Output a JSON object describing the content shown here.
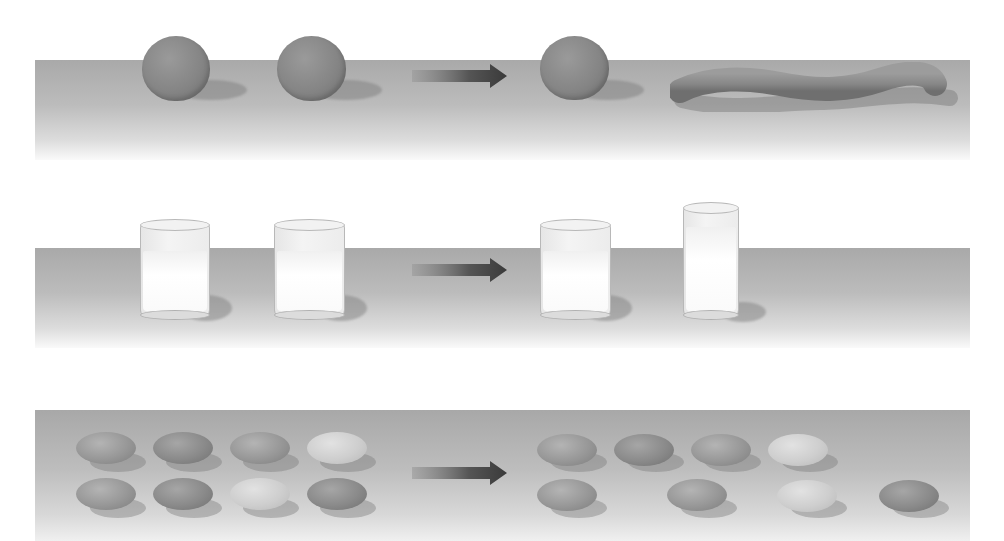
{
  "figure": {
    "arrow_icon": "right-arrow-icon",
    "colors": {
      "background": "#ffffff",
      "table_top": "#a9a9a9",
      "table_bottom": "#fafafa",
      "clay": "#858585",
      "arrow": "#4a4a4a",
      "glass": "#f2f2f2",
      "coin_dark": "#8a8a8a",
      "coin_light": "#cecece"
    },
    "rows": [
      {
        "name": "conservation-of-mass",
        "before": [
          "clay-ball",
          "clay-ball"
        ],
        "after": [
          "clay-ball",
          "clay-snake"
        ]
      },
      {
        "name": "conservation-of-liquid",
        "before": [
          "short-wide-glass",
          "short-wide-glass"
        ],
        "after": [
          "short-wide-glass",
          "tall-narrow-glass"
        ]
      },
      {
        "name": "conservation-of-number",
        "before": {
          "row1_count": 4,
          "row2_count": 4,
          "layout": "aligned"
        },
        "after": {
          "row1_count": 4,
          "row2_count": 4,
          "layout": "row 2 spread out"
        }
      }
    ]
  }
}
